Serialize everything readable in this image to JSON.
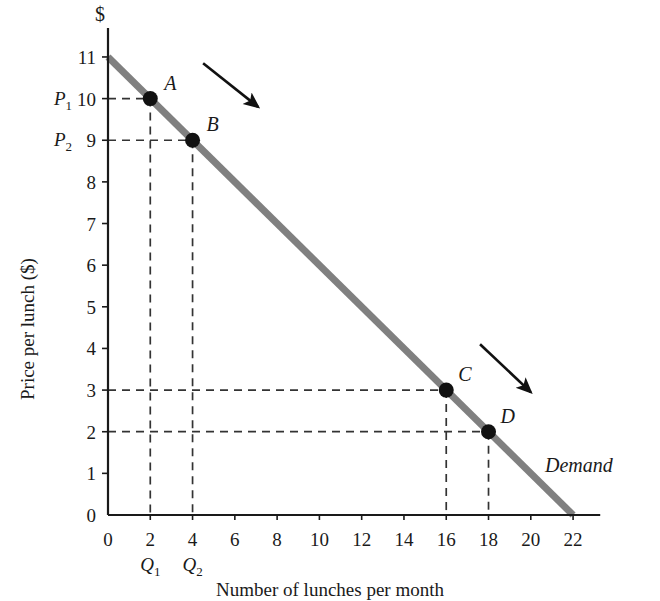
{
  "chart_data": {
    "type": "line",
    "title": "",
    "xlabel": "Number of lunches per month",
    "ylabel": "Price per lunch ($)",
    "y_axis_unit_symbol": "$",
    "xlim": [
      0,
      23
    ],
    "ylim": [
      0,
      11.6
    ],
    "x_ticks": [
      0,
      2,
      4,
      6,
      8,
      10,
      12,
      14,
      16,
      18,
      20,
      22
    ],
    "y_ticks": [
      0,
      1,
      2,
      3,
      4,
      5,
      6,
      7,
      8,
      9,
      10,
      11
    ],
    "grid": false,
    "legend": "none",
    "series": [
      {
        "name": "Demand",
        "label": "Demand",
        "color": "#808080",
        "x": [
          0,
          22
        ],
        "y": [
          11,
          0
        ],
        "linewidth": 7
      }
    ],
    "points": [
      {
        "id": "A",
        "label": "A",
        "x": 2,
        "y": 10,
        "label_dx": 14,
        "label_dy": -26
      },
      {
        "id": "B",
        "label": "B",
        "x": 4,
        "y": 9,
        "label_dx": 14,
        "label_dy": -26
      },
      {
        "id": "C",
        "label": "C",
        "x": 16,
        "y": 3,
        "label_dx": 12,
        "label_dy": -26
      },
      {
        "id": "D",
        "label": "D",
        "x": 18,
        "y": 2,
        "label_dx": 12,
        "label_dy": -26
      }
    ],
    "guide_labels": {
      "price_1": "P",
      "price_1_sub": "1",
      "price_2": "P",
      "price_2_sub": "2",
      "qty_1": "Q",
      "qty_1_sub": "1",
      "qty_2": "Q",
      "qty_2_sub": "2"
    },
    "annotations": [
      {
        "type": "arrow",
        "name": "movement-arrow-upper",
        "from": [
          4.5,
          10.85
        ],
        "to": [
          7.1,
          9.8
        ]
      },
      {
        "type": "arrow",
        "name": "movement-arrow-lower",
        "from": [
          17.6,
          4.1
        ],
        "to": [
          20.0,
          2.95
        ]
      }
    ],
    "dashed_guides": [
      {
        "from": [
          0,
          10
        ],
        "to": [
          2,
          10
        ]
      },
      {
        "from": [
          2,
          10
        ],
        "to": [
          2,
          0
        ]
      },
      {
        "from": [
          0,
          9
        ],
        "to": [
          4,
          9
        ]
      },
      {
        "from": [
          4,
          9
        ],
        "to": [
          4,
          0
        ]
      },
      {
        "from": [
          0,
          3
        ],
        "to": [
          16,
          3
        ]
      },
      {
        "from": [
          16,
          3
        ],
        "to": [
          16,
          0
        ]
      },
      {
        "from": [
          0,
          2
        ],
        "to": [
          18,
          2
        ]
      },
      {
        "from": [
          18,
          2
        ],
        "to": [
          18,
          0
        ]
      }
    ]
  }
}
